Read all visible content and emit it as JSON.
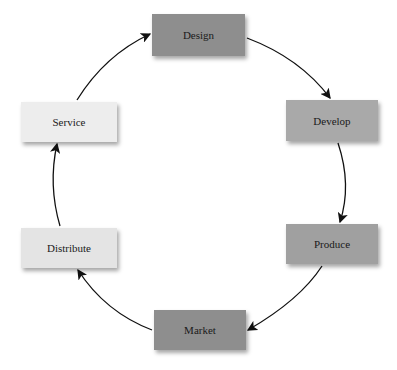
{
  "diagram": {
    "type": "cycle",
    "nodes": [
      {
        "id": "design",
        "label": "Design",
        "fill": "#8e8e8e",
        "x": 152,
        "y": 14,
        "w": 93,
        "h": 42
      },
      {
        "id": "develop",
        "label": "Develop",
        "fill": "#a9a9a9",
        "x": 286,
        "y": 100,
        "w": 92,
        "h": 41
      },
      {
        "id": "produce",
        "label": "Produce",
        "fill": "#a0a0a0",
        "x": 286,
        "y": 224,
        "w": 92,
        "h": 40
      },
      {
        "id": "market",
        "label": "Market",
        "fill": "#8e8e8e",
        "x": 154,
        "y": 310,
        "w": 92,
        "h": 40
      },
      {
        "id": "distribute",
        "label": "Distribute",
        "fill": "#e4e4e4",
        "x": 21,
        "y": 228,
        "w": 96,
        "h": 40
      },
      {
        "id": "service",
        "label": "Service",
        "fill": "#ededed",
        "x": 21,
        "y": 102,
        "w": 96,
        "h": 40
      }
    ],
    "edges": [
      {
        "from": "design",
        "to": "develop"
      },
      {
        "from": "develop",
        "to": "produce"
      },
      {
        "from": "produce",
        "to": "market"
      },
      {
        "from": "market",
        "to": "distribute"
      },
      {
        "from": "distribute",
        "to": "service"
      },
      {
        "from": "service",
        "to": "design"
      }
    ]
  }
}
